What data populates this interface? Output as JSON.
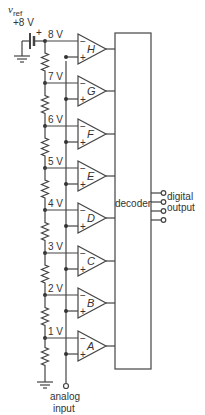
{
  "diagram": {
    "vref": {
      "label": "v",
      "subscript": "ref",
      "value": "+8 V"
    },
    "nodes": [
      {
        "label": "8 V",
        "y": 41,
        "comparator": "H"
      },
      {
        "label": "7 V",
        "y": 83,
        "comparator": "G"
      },
      {
        "label": "6 V",
        "y": 126,
        "comparator": "F"
      },
      {
        "label": "5 V",
        "y": 168,
        "comparator": "E"
      },
      {
        "label": "4 V",
        "y": 210,
        "comparator": "D"
      },
      {
        "label": "3 V",
        "y": 253,
        "comparator": "C"
      },
      {
        "label": "2 V",
        "y": 295,
        "comparator": "B"
      },
      {
        "label": "1 V",
        "y": 338,
        "comparator": "A"
      }
    ],
    "decoder_label": "decoder",
    "output_label_line1": "digital",
    "output_label_line2": "output",
    "input_label_line1": "analog",
    "input_label_line2": "input",
    "minus_sign": "−",
    "plus_sign": "+",
    "battery_plus": "+",
    "stroke_color": "#444444"
  }
}
